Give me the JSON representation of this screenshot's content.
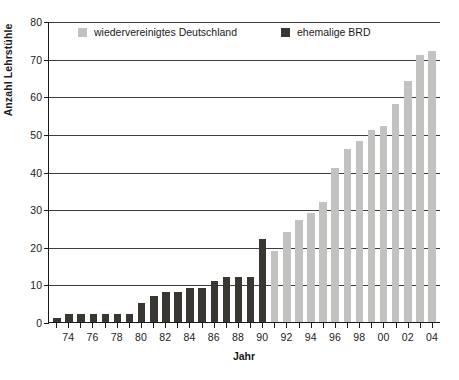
{
  "chart_data": {
    "type": "bar",
    "title": "",
    "xlabel": "Jahr",
    "ylabel": "Anzahl Lehrstühle",
    "ylim": [
      0,
      80
    ],
    "ytick_values": [
      0,
      10,
      20,
      30,
      40,
      50,
      60,
      70,
      80
    ],
    "ytick_labels": [
      "0",
      "10",
      "20",
      "30",
      "40",
      "50",
      "60",
      "70",
      "80"
    ],
    "grid": "horizontal",
    "legend_position": "top-inside",
    "categories": [
      "73",
      "74",
      "75",
      "76",
      "77",
      "78",
      "79",
      "80",
      "81",
      "82",
      "83",
      "84",
      "85",
      "86",
      "87",
      "88",
      "89",
      "90",
      "91",
      "92",
      "93",
      "94",
      "95",
      "96",
      "97",
      "98",
      "99",
      "00",
      "01",
      "02",
      "03",
      "04"
    ],
    "xtick_labels": [
      "",
      "74",
      "",
      "76",
      "",
      "78",
      "",
      "80",
      "",
      "82",
      "",
      "84",
      "",
      "86",
      "",
      "88",
      "",
      "90",
      "",
      "92",
      "",
      "94",
      "",
      "96",
      "",
      "98",
      "",
      "00",
      "",
      "02",
      "",
      "04"
    ],
    "series": [
      {
        "name": "ehemalige BRD",
        "color": "#3a3632",
        "key": "brd",
        "values": [
          1,
          2,
          2,
          2,
          2,
          2,
          2,
          5,
          7,
          8,
          8,
          9,
          9,
          11,
          12,
          12,
          12,
          22,
          null,
          null,
          null,
          null,
          null,
          null,
          null,
          null,
          null,
          null,
          null,
          null,
          null,
          null
        ]
      },
      {
        "name": "wiedervereinigtes Deutschland",
        "color": "#c2c2c0",
        "key": "deu",
        "values": [
          null,
          null,
          null,
          null,
          null,
          null,
          null,
          null,
          null,
          null,
          null,
          null,
          null,
          null,
          null,
          null,
          null,
          null,
          19,
          24,
          27,
          29,
          32,
          41,
          46,
          48,
          51,
          52,
          58,
          64,
          71,
          72
        ]
      }
    ]
  },
  "legend": {
    "items": [
      {
        "label": "wiedervereinigtes Deutschland",
        "key": "deu"
      },
      {
        "label": "ehemalige BRD",
        "key": "brd"
      }
    ]
  }
}
